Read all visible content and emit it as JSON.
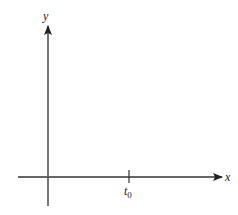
{
  "diagram": {
    "type": "coordinate-axes",
    "axes": {
      "x": {
        "label": "x"
      },
      "y": {
        "label": "y"
      }
    },
    "tick": {
      "label_main": "t",
      "label_sub": "0"
    },
    "colors": {
      "axis": "#333333",
      "y_axis": "#555555",
      "text": "#222222"
    }
  }
}
